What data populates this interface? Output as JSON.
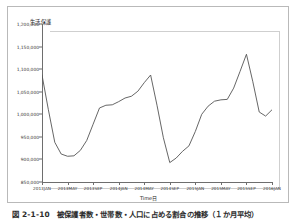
{
  "figure": {
    "caption": "図 2-1-10　被保護者数・世帯数・人口に占める割合の推移（１か月平均）",
    "frame_color": "#b9b9b9"
  },
  "chart_data": {
    "type": "line",
    "title": "",
    "ylabel": "生活保護",
    "xlabel": "Time日",
    "ylim": [
      850000,
      1200000
    ],
    "grid": false,
    "legend": null,
    "line_color": "#555555",
    "yticks": [
      "1,200,000",
      "1,150,000",
      "1,100,000",
      "1,050,000",
      "1,000,000",
      "950,000",
      "900,000",
      "850,000"
    ],
    "ytick_values": [
      1200000,
      1150000,
      1100000,
      1050000,
      1000000,
      950000,
      900000,
      850000
    ],
    "xticks": [
      "2013JAN",
      "2013MAY",
      "2013SEP",
      "2014JAN",
      "2014MAY",
      "2014SEP",
      "2015JAN",
      "2015MAY",
      "2015SEP",
      "2016JAN"
    ],
    "xtick_values": [
      0,
      4,
      8,
      12,
      16,
      20,
      24,
      28,
      32,
      36
    ],
    "x": [
      "2013JAN",
      "2013FEB",
      "2013MAR",
      "2013APR",
      "2013MAY",
      "2013JUN",
      "2013JUL",
      "2013AUG",
      "2013SEP",
      "2013OCT",
      "2013NOV",
      "2013DEC",
      "2014JAN",
      "2014FEB",
      "2014MAR",
      "2014APR",
      "2014MAY",
      "2014JUN",
      "2014JUL",
      "2014AUG",
      "2014SEP",
      "2014OCT",
      "2014NOV",
      "2014DEC",
      "2015JAN",
      "2015FEB",
      "2015MAR",
      "2015APR",
      "2015MAY",
      "2015JUN",
      "2015JUL",
      "2015AUG",
      "2015SEP",
      "2015OCT",
      "2015NOV",
      "2015DEC",
      "2016JAN"
    ],
    "values": [
      1087000,
      1010000,
      938000,
      912000,
      907000,
      908000,
      920000,
      942000,
      978000,
      1014000,
      1020000,
      1021000,
      1028000,
      1036000,
      1040000,
      1051000,
      1070000,
      1087000,
      1020000,
      948000,
      893000,
      903000,
      918000,
      930000,
      962000,
      1000000,
      1018000,
      1029000,
      1032000,
      1033000,
      1058000,
      1095000,
      1133000,
      1072000,
      1005000,
      996000,
      1010000
    ],
    "series_points": [
      [
        0,
        1087000
      ],
      [
        1,
        1010000
      ],
      [
        2,
        938000
      ],
      [
        3,
        912000
      ],
      [
        4,
        907000
      ],
      [
        5,
        908000
      ],
      [
        6,
        920000
      ],
      [
        7,
        942000
      ],
      [
        8,
        978000
      ],
      [
        9,
        1014000
      ],
      [
        10,
        1020000
      ],
      [
        11,
        1021000
      ],
      [
        12,
        1028000
      ],
      [
        13,
        1036000
      ],
      [
        14,
        1040000
      ],
      [
        15,
        1051000
      ],
      [
        16,
        1070000
      ],
      [
        17,
        1087000
      ],
      [
        18,
        1020000
      ],
      [
        19,
        948000
      ],
      [
        20,
        893000
      ],
      [
        21,
        903000
      ],
      [
        22,
        918000
      ],
      [
        23,
        930000
      ],
      [
        24,
        962000
      ],
      [
        25,
        1000000
      ],
      [
        26,
        1018000
      ],
      [
        27,
        1029000
      ],
      [
        28,
        1032000
      ],
      [
        29,
        1033000
      ],
      [
        30,
        1058000
      ],
      [
        31,
        1095000
      ],
      [
        32,
        1133000
      ],
      [
        33,
        1072000
      ],
      [
        34,
        1005000
      ],
      [
        35,
        996000
      ],
      [
        36,
        1010000
      ]
    ]
  }
}
